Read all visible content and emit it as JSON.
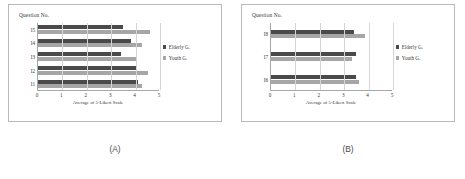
{
  "figure": {
    "background": "#ffffff",
    "panels": [
      {
        "id": "A",
        "caption": "(A)",
        "chart_data": {
          "type": "bar",
          "orientation": "horizontal",
          "title": "",
          "ylabel": "Question No.",
          "xlabel": "Average of 5-Likert Scale",
          "categories": [
            "I1",
            "I2",
            "I3",
            "I4",
            "I5"
          ],
          "display_order": [
            "I5",
            "I4",
            "I3",
            "I2",
            "I1"
          ],
          "series": [
            {
              "name": "Elderly G.",
              "color": "#4a4a4a",
              "values": [
                4.1,
                4.0,
                3.4,
                3.8,
                3.5
              ]
            },
            {
              "name": "Youth G.",
              "color": "#a6a6a6",
              "values": [
                4.25,
                4.5,
                4.0,
                4.25,
                4.6
              ]
            }
          ],
          "xlim": [
            0,
            5
          ],
          "xticks": [
            "0",
            "1",
            "2",
            "3",
            "4",
            "5"
          ],
          "grid": true,
          "legend_position": "right"
        }
      },
      {
        "id": "B",
        "caption": "(B)",
        "chart_data": {
          "type": "bar",
          "orientation": "horizontal",
          "title": "",
          "ylabel": "Question No.",
          "xlabel": "Average of 5-Likert Scale",
          "categories": [
            "I6",
            "I7",
            "I8"
          ],
          "display_order": [
            "I8",
            "I7",
            "I6"
          ],
          "series": [
            {
              "name": "Elderly G.",
              "color": "#4a4a4a",
              "values": [
                3.5,
                3.5,
                3.4
              ]
            },
            {
              "name": "Youth G.",
              "color": "#a6a6a6",
              "values": [
                3.6,
                3.3,
                3.85
              ]
            }
          ],
          "xlim": [
            0,
            5
          ],
          "xticks": [
            "0",
            "1",
            "2",
            "3",
            "4",
            "5"
          ],
          "grid": true,
          "legend_position": "right"
        }
      }
    ]
  }
}
